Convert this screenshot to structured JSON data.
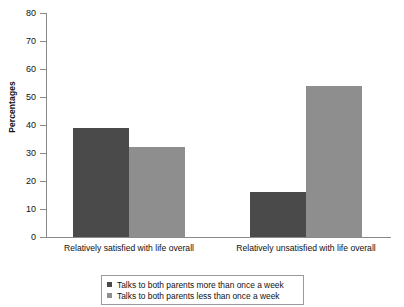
{
  "chart_data": {
    "type": "bar",
    "title": "",
    "subtitle": "",
    "xlabel": "",
    "ylabel": "Percentages",
    "ylim": [
      0,
      80
    ],
    "yticks": [
      0,
      10,
      20,
      30,
      40,
      50,
      60,
      70,
      80
    ],
    "ytick_labels": [
      "0",
      "10",
      "20",
      "30",
      "40",
      "50",
      "60",
      "70",
      "80"
    ],
    "grid": false,
    "legend_position": "bottom",
    "categories": [
      "Relatively satisfied with life overall",
      "Relatively unsatisfied with life overall"
    ],
    "series": [
      {
        "name": "Talks to both parents more than once a week",
        "color": "#4a4a4a",
        "values": [
          39,
          16
        ]
      },
      {
        "name": "Talks to both parents less than once a week",
        "color": "#8e8e8e",
        "values": [
          32,
          54
        ]
      }
    ],
    "annotations": []
  },
  "axis": {
    "y_title": "Percentages",
    "tick_labels": [
      "80",
      "70",
      "60",
      "50",
      "40",
      "30",
      "20",
      "10",
      "0"
    ]
  },
  "categories": {
    "first": "Relatively satisfied with life overall",
    "second": "Relatively unsatisfied with life overall"
  },
  "legend": {
    "items": [
      {
        "label": "Talks to both parents more than once a week",
        "swatch": "dark"
      },
      {
        "label": "Talks to both parents less than once a week",
        "swatch": "light"
      }
    ]
  },
  "colors": {
    "series_dark": "#4a4a4a",
    "series_light": "#8e8e8e",
    "axis": "#8a8a8a",
    "background": "#ffffff",
    "text": "#111111"
  }
}
